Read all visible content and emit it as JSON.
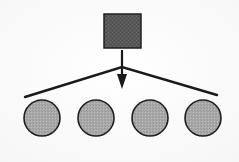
{
  "diagram": {
    "type": "node-link",
    "background_color": "#fdfdfd",
    "stroke_color": "#1a1a1a",
    "canvas": {
      "width": 239,
      "height": 162
    },
    "source_node": {
      "label": "",
      "shape": "square",
      "fill_color": "#585858",
      "texture": "dithered-crosshatch",
      "stroke_color": "#1f1f1f",
      "stroke_width": 1.5,
      "x": 104,
      "y": 14,
      "width": 37,
      "height": 34
    },
    "arrow": {
      "label": "",
      "direction": "down",
      "color": "#1a1a1a",
      "stem_x": 122,
      "stem_top_y": 50,
      "stem_bottom_y": 74,
      "head_tip_y": 89,
      "head_half_width": 5,
      "stem_width": 2
    },
    "fan_connector": {
      "label": "",
      "shape": "inverted-v",
      "color": "#1a1a1a",
      "stroke_width": 2.4,
      "apex_x": 122,
      "apex_y": 67,
      "left_end_x": 25,
      "left_end_y": 97,
      "right_end_x": 217,
      "right_end_y": 95
    },
    "target_nodes": [
      {
        "label": "",
        "shape": "circle",
        "fill_color": "#a8a8a8",
        "texture": "dithered-crosshatch",
        "stroke_color": "#1f1f1f",
        "stroke_width": 1.6,
        "cx": 42,
        "cy": 118,
        "r": 18
      },
      {
        "label": "",
        "shape": "circle",
        "fill_color": "#a8a8a8",
        "texture": "dithered-crosshatch",
        "stroke_color": "#1f1f1f",
        "stroke_width": 1.6,
        "cx": 96,
        "cy": 118,
        "r": 18
      },
      {
        "label": "",
        "shape": "circle",
        "fill_color": "#a8a8a8",
        "texture": "dithered-crosshatch",
        "stroke_color": "#1f1f1f",
        "stroke_width": 1.6,
        "cx": 150,
        "cy": 118,
        "r": 18
      },
      {
        "label": "",
        "shape": "circle",
        "fill_color": "#a8a8a8",
        "texture": "dithered-crosshatch",
        "stroke_color": "#1f1f1f",
        "stroke_width": 1.6,
        "cx": 203,
        "cy": 118,
        "r": 18
      }
    ]
  }
}
